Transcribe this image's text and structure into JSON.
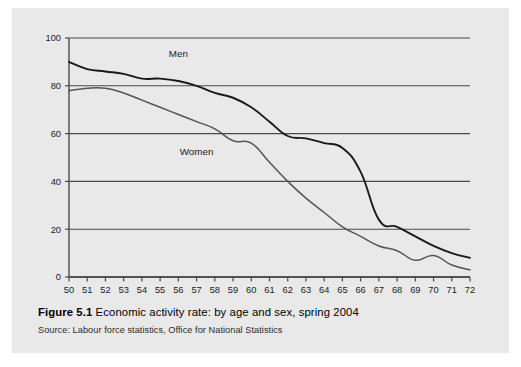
{
  "figure": {
    "label": "Figure 5.1",
    "caption": "Economic activity rate: by age and sex, spring 2004",
    "source": "Source: Labour force statistics, Office for National Statistics"
  },
  "colors": {
    "panel_background": "#e9e9e9",
    "page_background": "#ffffff",
    "gridline": "#4a4a4a",
    "axis": "#4a4a4a",
    "men_line": "#1a1a1a",
    "women_line": "#555555",
    "text": "#1a1a1a"
  },
  "chart_data": {
    "type": "line",
    "title": "Economic activity rate: by age and sex, spring 2004",
    "xlabel": "",
    "ylabel": "",
    "xlim": [
      50,
      72
    ],
    "ylim": [
      0,
      100
    ],
    "grid": true,
    "legend_position": "inline-annotation",
    "x": [
      50,
      51,
      52,
      53,
      54,
      55,
      56,
      57,
      58,
      59,
      60,
      61,
      62,
      63,
      64,
      65,
      66,
      67,
      68,
      69,
      70,
      71,
      72
    ],
    "xticklabels": [
      "50",
      "51",
      "52",
      "53",
      "54",
      "55",
      "56",
      "57",
      "58",
      "59",
      "60",
      "61",
      "62",
      "63",
      "64",
      "65",
      "66",
      "67",
      "68",
      "69",
      "70",
      "71",
      "72"
    ],
    "yticks": [
      0,
      20,
      40,
      60,
      80,
      100
    ],
    "yticklabels": [
      "0",
      "20",
      "40",
      "60",
      "80",
      "100"
    ],
    "series": [
      {
        "name": "Men",
        "label_x": 56,
        "label_y": 92,
        "values": [
          90,
          87,
          86,
          85,
          83,
          83,
          82,
          80,
          77,
          75,
          71,
          65,
          59,
          58,
          56,
          54,
          44,
          24,
          21,
          17,
          13,
          10,
          8
        ]
      },
      {
        "name": "Women",
        "label_x": 57,
        "label_y": 51,
        "values": [
          78,
          79,
          79,
          77,
          74,
          71,
          68,
          65,
          62,
          57,
          56,
          48,
          40,
          33,
          27,
          21,
          17,
          13,
          11,
          7,
          9,
          5,
          3
        ]
      }
    ],
    "annotations": [
      {
        "text": "Men",
        "x": 56,
        "y": 92
      },
      {
        "text": "Women",
        "x": 57,
        "y": 51
      }
    ]
  }
}
